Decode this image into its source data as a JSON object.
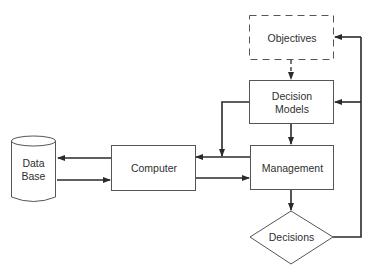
{
  "diagram": {
    "nodes": {
      "objectives": {
        "label": "Objectives",
        "shape": "dashed-rectangle"
      },
      "decision_models": {
        "label": "Decision\nModels",
        "shape": "rectangle"
      },
      "management": {
        "label": "Management",
        "shape": "rectangle"
      },
      "computer": {
        "label": "Computer",
        "shape": "rectangle"
      },
      "database": {
        "label": "Data\nBase",
        "shape": "cylinder"
      },
      "decisions": {
        "label": "Decisions",
        "shape": "diamond"
      }
    },
    "edges": [
      {
        "from": "objectives",
        "to": "decision_models",
        "style": "dashed"
      },
      {
        "from": "decision_models",
        "to": "management"
      },
      {
        "from": "decision_models",
        "to": "computer"
      },
      {
        "from": "management",
        "to": "computer"
      },
      {
        "from": "computer",
        "to": "management"
      },
      {
        "from": "computer",
        "to": "database"
      },
      {
        "from": "database",
        "to": "computer"
      },
      {
        "from": "management",
        "to": "decisions"
      },
      {
        "from": "decisions",
        "to": "decision_models"
      },
      {
        "from": "decisions",
        "to": "objectives"
      }
    ],
    "colors": {
      "stroke": "#3a3a3a",
      "background": "#ffffff"
    }
  }
}
